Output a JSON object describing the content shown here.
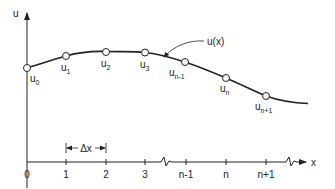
{
  "diagram": {
    "title": "",
    "axes": {
      "y_label": "u",
      "x_label": "x"
    },
    "curve_label": "u(x)",
    "spacing_label": "Δx",
    "ticks": [
      {
        "label": "0",
        "x": 27
      },
      {
        "label": "1",
        "x": 66
      },
      {
        "label": "2",
        "x": 106
      },
      {
        "label": "3",
        "x": 145
      },
      {
        "label": "n-1",
        "x": 186
      },
      {
        "label": "n",
        "x": 226
      },
      {
        "label": "n+1",
        "x": 266
      }
    ],
    "nodes": [
      {
        "base": "u",
        "sub": "0",
        "x": 27,
        "y": 68
      },
      {
        "base": "u",
        "sub": "1",
        "x": 66,
        "y": 56
      },
      {
        "base": "u",
        "sub": "2",
        "x": 106,
        "y": 52
      },
      {
        "base": "u",
        "sub": "3",
        "x": 145,
        "y": 52
      },
      {
        "base": "u",
        "sub": "n-1",
        "x": 185,
        "y": 62
      },
      {
        "base": "u",
        "sub": "n",
        "x": 226,
        "y": 78
      },
      {
        "base": "u",
        "sub": "n+1",
        "x": 266,
        "y": 96
      }
    ],
    "colors": {
      "line": "#222222",
      "node_fill": "#ffffff",
      "text": "#222222"
    }
  }
}
